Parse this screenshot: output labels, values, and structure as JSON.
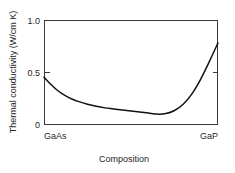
{
  "chart_data": {
    "type": "line",
    "title": "",
    "xlabel": "Composition",
    "ylabel": "Thermal conductivity (W/cm K)",
    "xlim": [
      0,
      1
    ],
    "ylim": [
      0,
      1
    ],
    "grid": false,
    "legend": "none",
    "x_tick_labels": [
      "GaAs",
      "GaP"
    ],
    "x_tick_values": [
      0,
      1
    ],
    "y_tick_labels": [
      "0",
      "0.5",
      "1.0"
    ],
    "y_tick_values": [
      0,
      0.5,
      1.0
    ],
    "series": [
      {
        "name": "Thermal conductivity of GaAs1-xPx alloy",
        "x": [
          0.0,
          0.04,
          0.08,
          0.12,
          0.16,
          0.2,
          0.25,
          0.3,
          0.35,
          0.4,
          0.45,
          0.5,
          0.55,
          0.6,
          0.65,
          0.7,
          0.75,
          0.8,
          0.85,
          0.9,
          0.95,
          1.0
        ],
        "values": [
          0.45,
          0.38,
          0.32,
          0.275,
          0.24,
          0.215,
          0.19,
          0.17,
          0.155,
          0.145,
          0.135,
          0.125,
          0.115,
          0.105,
          0.095,
          0.1,
          0.13,
          0.19,
          0.29,
          0.43,
          0.6,
          0.78
        ]
      }
    ]
  },
  "axis": {
    "y_title": "Thermal conductivity (W/cm K)",
    "x_title": "Composition",
    "y_tick_top": "1.0",
    "y_tick_mid": "0.5",
    "y_tick_bottom": "0",
    "x_cat_left": "GaAs",
    "x_cat_right": "GaP"
  },
  "colors": {
    "curve": "#111111",
    "frame": "#3a3a3a",
    "text": "#262626",
    "background": "#ffffff"
  }
}
